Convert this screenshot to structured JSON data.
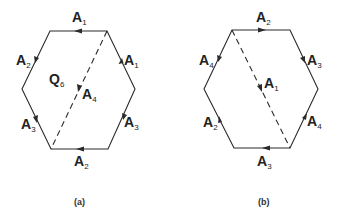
{
  "figure": {
    "panels": [
      {
        "id": "a",
        "caption": "(a)",
        "center_label": {
          "letter": "Q",
          "sub": "6"
        },
        "edges": [
          {
            "position": "top",
            "letter": "A",
            "sub": "1"
          },
          {
            "position": "upper-right",
            "letter": "A",
            "sub": "1"
          },
          {
            "position": "lower-right",
            "letter": "A",
            "sub": "3"
          },
          {
            "position": "bottom",
            "letter": "A",
            "sub": "2"
          },
          {
            "position": "lower-left",
            "letter": "A",
            "sub": "3"
          },
          {
            "position": "upper-left",
            "letter": "A",
            "sub": "2"
          }
        ],
        "diagonal": {
          "letter": "A",
          "sub": "4"
        }
      },
      {
        "id": "b",
        "caption": "(b)",
        "edges": [
          {
            "position": "top",
            "letter": "A",
            "sub": "2"
          },
          {
            "position": "upper-right",
            "letter": "A",
            "sub": "3"
          },
          {
            "position": "lower-right",
            "letter": "A",
            "sub": "4"
          },
          {
            "position": "bottom",
            "letter": "A",
            "sub": "3"
          },
          {
            "position": "lower-left",
            "letter": "A",
            "sub": "2"
          },
          {
            "position": "upper-left",
            "letter": "A",
            "sub": "4"
          }
        ],
        "diagonal": {
          "letter": "A",
          "sub": "1"
        }
      }
    ]
  }
}
